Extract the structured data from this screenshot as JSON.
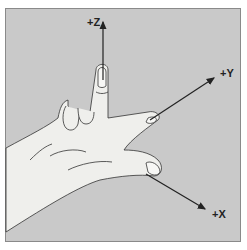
{
  "diagram": {
    "axes": [
      {
        "label": "+Z",
        "direction": "up"
      },
      {
        "label": "+Y",
        "direction": "upper-right"
      },
      {
        "label": "+X",
        "direction": "lower-right"
      }
    ],
    "colors": {
      "background": "#c9c9c9",
      "hand": "#efefec",
      "outline": "#333333",
      "axis": "#222222"
    }
  }
}
